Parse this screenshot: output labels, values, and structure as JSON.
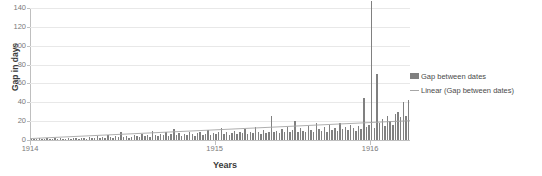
{
  "chart_data": {
    "type": "bar",
    "title": "",
    "xlabel": "Years",
    "ylabel": "Gap in days",
    "ylim": [
      0,
      140
    ],
    "yticks": [
      0,
      20,
      40,
      60,
      80,
      100,
      120,
      140
    ],
    "xticks": [
      "1914",
      "1915",
      "1916"
    ],
    "xtick_positions": [
      0,
      0.486,
      0.895
    ],
    "grid": true,
    "legend_position": "right",
    "legend": [
      {
        "name": "Gap between dates",
        "marker": "bar",
        "color": "#808080"
      },
      {
        "name": "Linear (Gap between dates)",
        "marker": "line",
        "color": "#a6a6a6"
      }
    ],
    "series": [
      {
        "name": "Gap between dates",
        "type": "bar",
        "color": "#808080",
        "values": [
          1,
          1,
          1,
          2,
          1,
          1,
          2,
          1,
          1,
          2,
          1,
          2,
          1,
          1,
          2,
          1,
          2,
          2,
          1,
          2,
          2,
          1,
          3,
          2,
          2,
          4,
          2,
          3,
          2,
          5,
          3,
          2,
          4,
          3,
          8,
          3,
          4,
          2,
          3,
          5,
          4,
          3,
          6,
          4,
          5,
          3,
          10,
          5,
          4,
          6,
          5,
          9,
          4,
          6,
          12,
          5,
          7,
          4,
          6,
          5,
          8,
          6,
          4,
          7,
          9,
          5,
          6,
          11,
          5,
          7,
          6,
          9,
          13,
          6,
          8,
          5,
          7,
          10,
          6,
          8,
          7,
          12,
          6,
          9,
          7,
          14,
          8,
          6,
          11,
          7,
          9,
          25,
          8,
          10,
          7,
          12,
          9,
          14,
          8,
          11,
          20,
          9,
          13,
          10,
          8,
          15,
          11,
          9,
          18,
          12,
          10,
          14,
          9,
          16,
          11,
          13,
          10,
          18,
          12,
          14,
          11,
          16,
          13,
          10,
          15,
          12,
          45,
          14,
          16,
          147,
          13,
          70,
          18,
          22,
          15,
          25,
          20,
          16,
          28,
          30,
          24,
          40,
          26,
          42
        ]
      },
      {
        "name": "Linear (Gap between dates)",
        "type": "line",
        "color": "#a6a6a6",
        "trend_start": 1.5,
        "trend_end": 20.5
      }
    ]
  },
  "legend_labels": {
    "bars": "Gap between dates",
    "trend": "Linear (Gap between dates)"
  },
  "axis": {
    "y_title": "Gap in days",
    "x_title": "Years"
  }
}
